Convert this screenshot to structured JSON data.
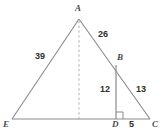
{
  "figure": {
    "kind": "geometry-diagram",
    "stroke_color": "#8a8a8a",
    "dash_color": "#b0b0b0",
    "label_color": "#3b3b3b",
    "background": "#ffffff"
  },
  "vertices": [
    {
      "id": "A",
      "label": "A",
      "x": 79,
      "y": 19
    },
    {
      "id": "B",
      "label": "B",
      "x": 116,
      "y": 65
    },
    {
      "id": "C",
      "label": "C",
      "x": 150,
      "y": 119
    },
    {
      "id": "D",
      "label": "D",
      "x": 116,
      "y": 119
    },
    {
      "id": "E",
      "label": "E",
      "x": 12,
      "y": 119
    }
  ],
  "segments": [
    {
      "id": "AE",
      "from": "A",
      "to": "E",
      "style": "solid"
    },
    {
      "id": "AC",
      "from": "A",
      "to": "C",
      "style": "solid"
    },
    {
      "id": "EC",
      "from": "E",
      "to": "C",
      "style": "solid"
    },
    {
      "id": "BD",
      "from": "B",
      "to": "D",
      "style": "solid"
    },
    {
      "id": "altitude",
      "from": "A",
      "to": "F",
      "style": "dashed"
    }
  ],
  "measures": {
    "ae": "39",
    "ab": "26",
    "bd": "12",
    "bc": "13",
    "dc": "5"
  },
  "markers": {
    "right_angle_at": "D",
    "right_angle_label": "right-angle-square"
  }
}
